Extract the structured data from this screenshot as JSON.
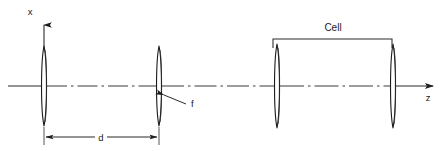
{
  "figure": {
    "background_color": "#ffffff",
    "line_color": "#1f1f1f",
    "width": 445,
    "height": 151
  },
  "axes": {
    "vertical": {
      "label": "x",
      "label_x": 30,
      "label_y": 15,
      "origin_x": 44,
      "origin_y": 86,
      "tip_x": 44,
      "tip_y": 16
    },
    "horizontal": {
      "label": "z",
      "label_x": 428,
      "label_y": 101,
      "start_x": 8,
      "start_y": 86,
      "tip_x": 441,
      "tip_y": 86,
      "style": "dash-dot"
    }
  },
  "elements": [
    {
      "name": "mirror-left",
      "kind": "lens",
      "cx": 44,
      "cy": 86,
      "half_height": 40,
      "half_width": 3.2
    },
    {
      "name": "lens-f",
      "kind": "lens",
      "cx": 159,
      "cy": 86,
      "half_height": 40,
      "half_width": 3.2
    },
    {
      "name": "cell-window-left",
      "kind": "lens",
      "cx": 277,
      "cy": 86,
      "half_height": 42,
      "half_width": 3.2
    },
    {
      "name": "cell-window-right",
      "kind": "lens",
      "cx": 393,
      "cy": 86,
      "half_height": 42,
      "half_width": 3.2
    }
  ],
  "annotations": {
    "focal_length": {
      "label": "f",
      "label_x": 191,
      "label_y": 107,
      "leader_from_x": 186,
      "leader_from_y": 104,
      "leader_to_x": 164,
      "leader_to_y": 95
    },
    "cell_bracket": {
      "label": "Cell",
      "label_x": 333,
      "label_y": 31,
      "left_x": 273,
      "right_x": 392,
      "top_y": 39,
      "tick_bottom_y": 48
    },
    "distance": {
      "label": "d",
      "label_x": 101,
      "label_y": 141,
      "left_x": 44,
      "right_x": 159,
      "line_y": 137,
      "ext_top_y": 126,
      "ext_bottom_y": 145,
      "gap_left_x": 94,
      "gap_right_x": 108
    }
  }
}
